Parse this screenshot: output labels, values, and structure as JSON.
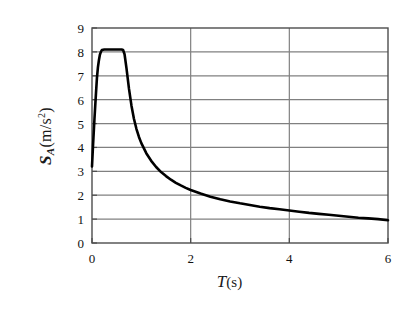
{
  "chart_data": {
    "type": "line",
    "title": "",
    "subtitle": "",
    "xlabel": "T (s)",
    "xlabel_symbol": "T",
    "xlabel_unit": "(s)",
    "ylabel": "SA (m/s^2)",
    "ylabel_symbol": "S",
    "ylabel_subscript": "A",
    "ylabel_unit": "(m/s",
    "ylabel_unit_sup": "2",
    "ylabel_unit_close": ")",
    "xlim": [
      0,
      6
    ],
    "ylim": [
      0,
      9
    ],
    "xticks": [
      0,
      2,
      4,
      6
    ],
    "xtick_labels": [
      "0",
      "2",
      "4",
      "6"
    ],
    "yticks": [
      0,
      1,
      2,
      3,
      4,
      5,
      6,
      7,
      8,
      9
    ],
    "ytick_labels": [
      "0",
      "1",
      "2",
      "3",
      "4",
      "5",
      "6",
      "7",
      "8",
      "9"
    ],
    "grid": true,
    "grid_x": true,
    "grid_y": true,
    "legend": false,
    "legend_position": "none",
    "line_color": "#000000",
    "line_width": 2.6,
    "grid_color": "#808080",
    "axis_color": "#4d4d4d",
    "background": "#ffffff",
    "series": [
      {
        "name": "acceleration response spectrum",
        "x": [
          0.0,
          0.02,
          0.05,
          0.08,
          0.1,
          0.12,
          0.14,
          0.16,
          0.18,
          0.2,
          0.25,
          0.3,
          0.35,
          0.4,
          0.45,
          0.5,
          0.55,
          0.6,
          0.63,
          0.66,
          0.7,
          0.75,
          0.8,
          0.85,
          0.9,
          0.95,
          1.0,
          1.1,
          1.2,
          1.3,
          1.4,
          1.5,
          1.6,
          1.7,
          1.8,
          1.9,
          2.0,
          2.2,
          2.4,
          2.6,
          2.8,
          3.0,
          3.2,
          3.4,
          3.6,
          3.8,
          4.0,
          4.2,
          4.4,
          4.6,
          4.8,
          5.0,
          5.2,
          5.4,
          5.6,
          5.8,
          6.0
        ],
        "y": [
          3.2,
          4.05,
          5.2,
          6.25,
          6.9,
          7.35,
          7.65,
          7.88,
          8.0,
          8.08,
          8.1,
          8.1,
          8.1,
          8.1,
          8.1,
          8.1,
          8.1,
          8.1,
          8.08,
          7.9,
          7.3,
          6.45,
          5.75,
          5.2,
          4.78,
          4.45,
          4.18,
          3.76,
          3.44,
          3.18,
          2.97,
          2.8,
          2.65,
          2.52,
          2.41,
          2.31,
          2.22,
          2.07,
          1.94,
          1.83,
          1.74,
          1.66,
          1.59,
          1.52,
          1.46,
          1.41,
          1.36,
          1.31,
          1.26,
          1.22,
          1.18,
          1.14,
          1.1,
          1.06,
          1.03,
          1.0,
          0.95
        ]
      }
    ],
    "annotations": []
  },
  "figure": {
    "name": "acceleration-response-spectrum"
  }
}
